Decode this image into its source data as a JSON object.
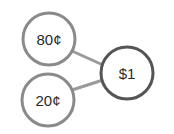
{
  "diagram": {
    "type": "number-bond",
    "whole": {
      "label": "$1"
    },
    "parts": [
      {
        "label": "80¢"
      },
      {
        "label": "20¢"
      }
    ],
    "colors": {
      "part_stroke": "#8a8a8a",
      "whole_stroke": "#555555",
      "connector": "#9a9a9a",
      "text": "#2a2a2a",
      "background": "#ffffff"
    }
  }
}
